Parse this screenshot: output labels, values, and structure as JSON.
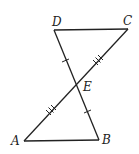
{
  "diagram": {
    "type": "geometry",
    "points": {
      "A": {
        "label": "A",
        "x": 24,
        "y": 141
      },
      "B": {
        "label": "B",
        "x": 99,
        "y": 140
      },
      "C": {
        "label": "C",
        "x": 128,
        "y": 29
      },
      "D": {
        "label": "D",
        "x": 54,
        "y": 30
      },
      "E": {
        "label": "E",
        "x": 77,
        "y": 84
      }
    },
    "segments": [
      "DC",
      "AB",
      "AC",
      "DB"
    ],
    "congruence_marks": [
      {
        "segments": [
          "DE",
          "EB"
        ],
        "ticks": 1
      },
      {
        "segments": [
          "AE",
          "EC"
        ],
        "ticks": 3
      }
    ],
    "colors": {
      "stroke": "#222222",
      "background": "#ffffff"
    }
  }
}
